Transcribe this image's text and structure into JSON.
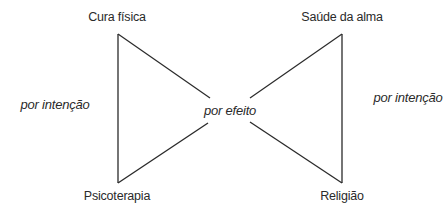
{
  "diagram": {
    "nodes": {
      "top_left": "Cura física",
      "top_right": "Saúde da alma",
      "bottom_left": "Psicoterapia",
      "bottom_right": "Religião"
    },
    "edges": {
      "left": "por intenção",
      "center": "por efeito",
      "right": "por intenção"
    },
    "line_color": "#2a2a2a"
  }
}
